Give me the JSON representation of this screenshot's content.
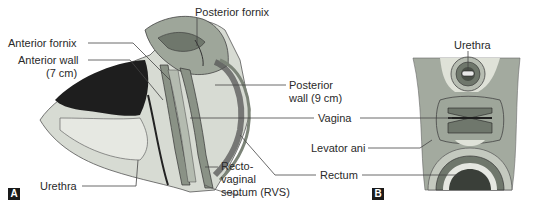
{
  "figure": {
    "panels": [
      {
        "id": "A",
        "tag": "A",
        "view": "sagittal section",
        "labels": {
          "posterior_fornix": "Posterior fornix",
          "anterior_fornix": "Anterior fornix",
          "anterior_wall_line1": "Anterior wall",
          "anterior_wall_line2": "(7 cm)",
          "posterior_wall_line1": "Posterior",
          "posterior_wall_line2": "wall (9 cm)",
          "vagina": "Vagina",
          "rectum": "Rectum",
          "urethra": "Urethra",
          "rvs_line1": "Recto-",
          "rvs_line2": "vaginal",
          "rvs_line3": "septum (RVS)"
        }
      },
      {
        "id": "B",
        "tag": "B",
        "view": "transverse section",
        "labels": {
          "urethra": "Urethra",
          "levator_ani": "Levator ani"
        }
      }
    ],
    "colors": {
      "tissue_light": "#cfd3cc",
      "tissue_mid": "#9ea69a",
      "tissue_dark": "#6f776c",
      "cavity_dark": "#1e1e1e",
      "outline": "#3c3c3c",
      "leader_line": "#444444"
    }
  }
}
